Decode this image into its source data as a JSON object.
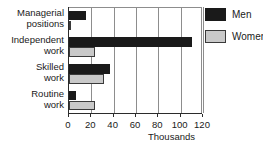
{
  "chart_data": {
    "type": "bar",
    "orientation": "horizontal",
    "title": "",
    "xlabel": "Thousands",
    "ylabel": "",
    "xlim": [
      0,
      120
    ],
    "xticks": [
      0,
      20,
      40,
      60,
      80,
      100,
      120
    ],
    "grid": true,
    "legend_position": "right",
    "categories": [
      "Managerial positions",
      "Independent work",
      "Skilled work",
      "Routine work"
    ],
    "category_lines": [
      [
        "Managerial",
        "positions"
      ],
      [
        "Independent",
        "work"
      ],
      [
        "Skilled",
        "work"
      ],
      [
        "Routine",
        "work"
      ]
    ],
    "series": [
      {
        "name": "Men",
        "color": "#1a1a1a",
        "values": [
          15,
          110,
          37,
          6
        ]
      },
      {
        "name": "Women",
        "color": "#c9c9c9",
        "values": [
          1,
          23,
          31,
          23
        ]
      }
    ]
  }
}
